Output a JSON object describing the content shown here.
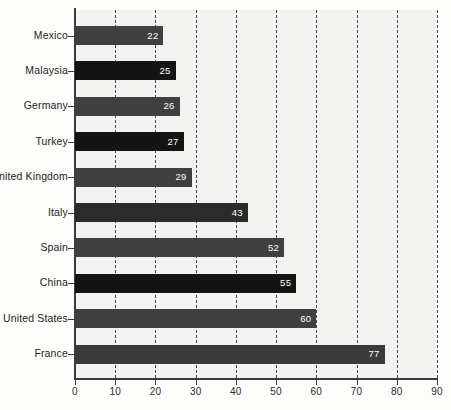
{
  "chart_data": {
    "type": "bar",
    "orientation": "horizontal",
    "title": "",
    "subtitle": "",
    "xlabel": "",
    "ylabel": "",
    "xlim": [
      0,
      90
    ],
    "xticks": [
      0,
      10,
      20,
      30,
      40,
      50,
      60,
      70,
      80,
      90
    ],
    "xtick_labels": [
      "0",
      "10",
      "20",
      "30",
      "40",
      "50",
      "60",
      "70",
      "80",
      "90"
    ],
    "grid": "vertical-dashed",
    "legend": "none",
    "categories": [
      "Mexico",
      "Malaysia",
      "Germany",
      "Turkey",
      "United Kingdom",
      "Italy",
      "Spain",
      "China",
      "United States",
      "France"
    ],
    "values": [
      22,
      25,
      26,
      27,
      29,
      43,
      52,
      55,
      60,
      77
    ],
    "value_labels": [
      "22",
      "25",
      "26",
      "27",
      "29",
      "43",
      "52",
      "55",
      "60",
      "77"
    ],
    "bar_colors": [
      "#404040",
      "#141414",
      "#404040",
      "#141414",
      "#404040",
      "#2b2b2b",
      "#404040",
      "#141414",
      "#404040",
      "#3a3a3a"
    ],
    "plot_background": "#f2f2f0",
    "page_background": "#fdfdfc",
    "axis_color": "#3b3b3b",
    "gridline_color": "#4a4a4a",
    "value_label_color": "#ffffff"
  }
}
